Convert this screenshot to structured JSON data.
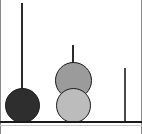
{
  "figure": {
    "title": "",
    "background_color": "#ffffff",
    "width": 142,
    "height": 134,
    "frame_color": "#8a8a8a",
    "baseline": {
      "label": "baseline",
      "y": 121,
      "color": "#1a1a1a",
      "thickness": 2
    },
    "caption": {
      "text": "",
      "y": 124
    }
  },
  "chart_data": {
    "type": "scatter",
    "title": "",
    "xlabel": "",
    "ylabel": "",
    "grid": false,
    "legend": null,
    "categories": [
      "stem-1",
      "stem-2",
      "stem-3"
    ],
    "items": [
      {
        "name": "stem-1",
        "stem": {
          "x": 22,
          "top": 3,
          "bottom": 106,
          "width": 2,
          "color": "#2b2b2b"
        },
        "nodes": [
          {
            "name": "node-dark",
            "cx": 22,
            "cy": 105,
            "diameter": 35,
            "fill": "#2e2e2e",
            "stroke": "#1a1a1a",
            "shade": "dark"
          }
        ]
      },
      {
        "name": "stem-2",
        "stem": {
          "x": 73,
          "top": 45,
          "bottom": 63,
          "width": 2,
          "color": "#2b2b2b"
        },
        "nodes": [
          {
            "name": "node-medium",
            "cx": 73,
            "cy": 80,
            "diameter": 37,
            "fill": "#9b9b9b",
            "stroke": "#1a1a1a",
            "shade": "medium"
          },
          {
            "name": "node-light",
            "cx": 73,
            "cy": 105,
            "diameter": 35,
            "fill": "#bcbcbc",
            "stroke": "#1a1a1a",
            "shade": "light"
          }
        ]
      },
      {
        "name": "stem-3",
        "stem": {
          "x": 125,
          "top": 68,
          "bottom": 121,
          "width": 2,
          "color": "#4a4a4a"
        },
        "nodes": []
      }
    ],
    "colors": {
      "dark_node": "#2e2e2e",
      "medium_node": "#9b9b9b",
      "light_node": "#bcbcbc",
      "stem": "#2b2b2b",
      "baseline": "#1a1a1a"
    }
  }
}
